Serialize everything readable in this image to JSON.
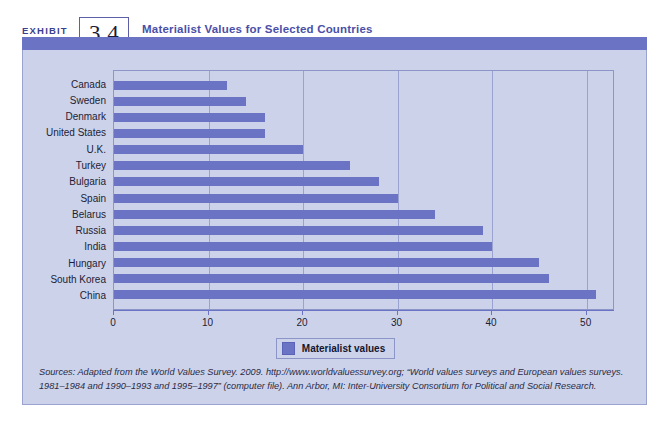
{
  "header": {
    "exhibit_word": "EXHIBIT",
    "exhibit_number": "3.4",
    "title": "Materialist Values for Selected Countries"
  },
  "legend": {
    "label": "Materialist values",
    "swatch_color": "#6b73c4"
  },
  "source": {
    "text": "Sources: Adapted from the World Values Survey. 2009. http://www.worldvaluessurvey.org; “World values surveys and European values surveys. 1981–1984 and 1990–1993 and 1995–1997” (computer file). Ann Arbor, MI: Inter-University Consortium for Political and Social Research."
  },
  "colors": {
    "bar": "#6b73c4",
    "panel_background": "#ccd2ea",
    "header_bar": "#6b73c4",
    "title_text": "#4a4fa8",
    "gridline": "#9aa3d0",
    "plot_border": "#8c95c8"
  },
  "chart_data": {
    "type": "bar",
    "orientation": "horizontal",
    "title": "Materialist Values for Selected Countries",
    "xlabel": "",
    "ylabel": "",
    "xlim": [
      0,
      53
    ],
    "ylim": null,
    "grid": true,
    "legend_position": "bottom-center",
    "xticks": [
      0,
      10,
      20,
      30,
      40,
      50
    ],
    "xtick_labels": [
      "0",
      "10",
      "20",
      "30",
      "40",
      "50"
    ],
    "categories": [
      "Canada",
      "Sweden",
      "Denmark",
      "United States",
      "U.K.",
      "Turkey",
      "Bulgaria",
      "Spain",
      "Belarus",
      "Russia",
      "India",
      "Hungary",
      "South Korea",
      "China"
    ],
    "series": [
      {
        "name": "Materialist values",
        "color": "#6b73c4",
        "values": [
          12,
          14,
          16,
          16,
          20,
          25,
          28,
          30,
          34,
          39,
          40,
          45,
          46,
          51
        ]
      }
    ]
  }
}
